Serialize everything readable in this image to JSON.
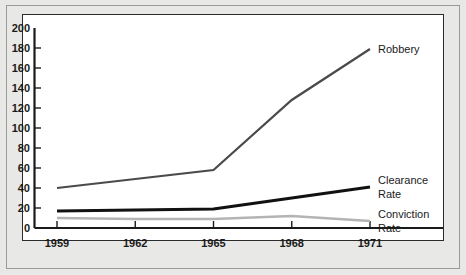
{
  "chart_data": {
    "type": "line",
    "title": "",
    "xlabel": "",
    "ylabel": "",
    "x": [
      1959,
      1962,
      1965,
      1968,
      1971
    ],
    "xtick_labels": [
      "1959",
      "1962",
      "1965",
      "1968",
      "1971"
    ],
    "ytick_labels": [
      "0",
      "20",
      "40",
      "60",
      "80",
      "100",
      "120",
      "140",
      "160",
      "180",
      "200"
    ],
    "ytick_values": [
      0,
      20,
      40,
      60,
      80,
      100,
      120,
      140,
      160,
      180,
      200
    ],
    "ylim": [
      0,
      200
    ],
    "xlim": [
      1959,
      1971
    ],
    "grid": false,
    "legend_position": "right-inline",
    "series": [
      {
        "name": "Robbery",
        "label_line1": "Robbery",
        "label_line2": "",
        "color": "#4a4a4a",
        "width": 2.2,
        "values": [
          40,
          49,
          58,
          128,
          179
        ]
      },
      {
        "name": "Clearance Rate",
        "label_line1": "Clearance",
        "label_line2": "Rate",
        "color": "#111111",
        "width": 3.0,
        "values": [
          17,
          18,
          19,
          30,
          41
        ]
      },
      {
        "name": "Conviction Rate",
        "label_line1": "Conviction",
        "label_line2": "Rate",
        "color": "#b4b4b4",
        "width": 2.6,
        "values": [
          10,
          9,
          9,
          12,
          7
        ]
      }
    ]
  },
  "colors": {
    "page_background": "#e8e8e6",
    "plot_background": "#ffffff",
    "axis": "#1a1a1a",
    "frame": "#9a9a96"
  }
}
